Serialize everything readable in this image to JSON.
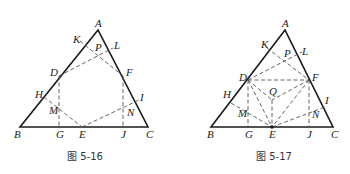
{
  "figures": [
    {
      "caption": "图 5-16",
      "labels": {
        "A": "A",
        "B": "B",
        "C": "C",
        "D": "D",
        "E": "E",
        "F": "F",
        "G": "G",
        "H": "H",
        "I": "I",
        "J": "J",
        "K": "K",
        "L": "L",
        "M": "M",
        "N": "N",
        "P": "P"
      }
    },
    {
      "caption": "图 5-17",
      "labels": {
        "A": "A",
        "B": "B",
        "C": "C",
        "D": "D",
        "E": "E",
        "F": "F",
        "G": "G",
        "H": "H",
        "I": "I",
        "J": "J",
        "K": "K",
        "L": "L",
        "M": "M",
        "N": "N",
        "P": "P",
        "Q": "Q"
      }
    }
  ]
}
